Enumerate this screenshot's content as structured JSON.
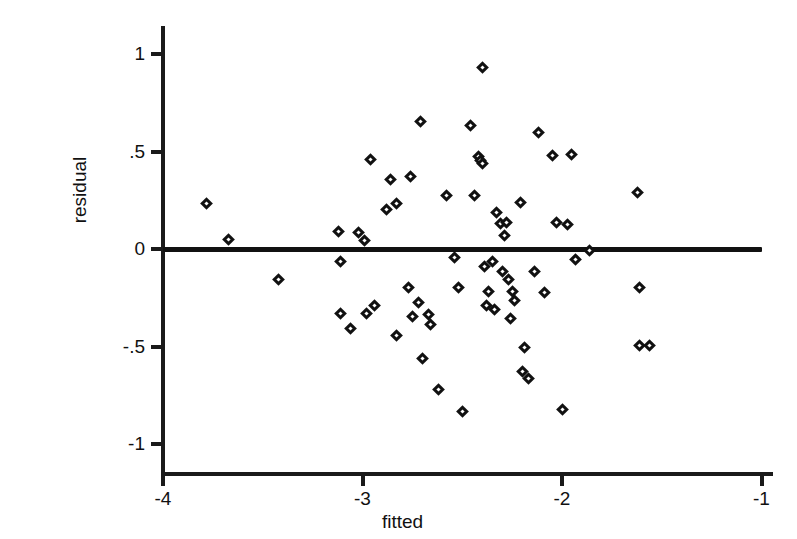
{
  "chart_data": {
    "type": "scatter",
    "title": "",
    "xlabel": "fitted",
    "ylabel": "residual",
    "xlim": [
      -4.0,
      -1.0
    ],
    "ylim": [
      -1.15,
      1.08
    ],
    "xticks": [
      -4,
      -3,
      -2,
      -1
    ],
    "xtick_labels": [
      "-4",
      "-3",
      "-2",
      "-1"
    ],
    "yticks": [
      1,
      0.5,
      0,
      -0.5,
      -1
    ],
    "ytick_labels": [
      "1",
      ".5",
      "0",
      "-.5",
      "-1"
    ],
    "grid": false,
    "legend": null,
    "marker": "open-diamond",
    "marker_color": "#111111",
    "reference_line": {
      "type": "horizontal",
      "y": 0,
      "x_start": -4.0,
      "x_end": -1.0,
      "color": "#111111"
    },
    "points": [
      {
        "x": -3.78,
        "y": 0.235
      },
      {
        "x": -3.67,
        "y": 0.05
      },
      {
        "x": -3.42,
        "y": -0.155
      },
      {
        "x": -3.12,
        "y": 0.09
      },
      {
        "x": -3.11,
        "y": -0.065
      },
      {
        "x": -3.11,
        "y": -0.33
      },
      {
        "x": -3.06,
        "y": -0.41
      },
      {
        "x": -3.02,
        "y": 0.085
      },
      {
        "x": -2.99,
        "y": 0.045
      },
      {
        "x": -2.98,
        "y": -0.33
      },
      {
        "x": -2.96,
        "y": 0.46
      },
      {
        "x": -2.94,
        "y": -0.29
      },
      {
        "x": -2.88,
        "y": 0.205
      },
      {
        "x": -2.86,
        "y": 0.355
      },
      {
        "x": -2.83,
        "y": 0.235
      },
      {
        "x": -2.83,
        "y": -0.445
      },
      {
        "x": -2.77,
        "y": -0.195
      },
      {
        "x": -2.76,
        "y": 0.37
      },
      {
        "x": -2.75,
        "y": -0.345
      },
      {
        "x": -2.72,
        "y": -0.275
      },
      {
        "x": -2.71,
        "y": 0.655
      },
      {
        "x": -2.7,
        "y": -0.56
      },
      {
        "x": -2.67,
        "y": -0.335
      },
      {
        "x": -2.66,
        "y": -0.385
      },
      {
        "x": -2.62,
        "y": -0.72
      },
      {
        "x": -2.58,
        "y": 0.275
      },
      {
        "x": -2.54,
        "y": -0.045
      },
      {
        "x": -2.52,
        "y": -0.195
      },
      {
        "x": -2.5,
        "y": -0.835
      },
      {
        "x": -2.46,
        "y": 0.635
      },
      {
        "x": -2.44,
        "y": 0.275
      },
      {
        "x": -2.42,
        "y": 0.475
      },
      {
        "x": -2.41,
        "y": 0.455
      },
      {
        "x": -2.4,
        "y": 0.44
      },
      {
        "x": -2.4,
        "y": 0.93
      },
      {
        "x": -2.39,
        "y": -0.09
      },
      {
        "x": -2.38,
        "y": -0.29
      },
      {
        "x": -2.37,
        "y": -0.22
      },
      {
        "x": -2.35,
        "y": -0.065
      },
      {
        "x": -2.34,
        "y": -0.31
      },
      {
        "x": -2.33,
        "y": 0.185
      },
      {
        "x": -2.31,
        "y": 0.13
      },
      {
        "x": -2.3,
        "y": -0.115
      },
      {
        "x": -2.29,
        "y": 0.07
      },
      {
        "x": -2.28,
        "y": 0.135
      },
      {
        "x": -2.27,
        "y": -0.155
      },
      {
        "x": -2.26,
        "y": -0.355
      },
      {
        "x": -2.25,
        "y": -0.22
      },
      {
        "x": -2.24,
        "y": -0.265
      },
      {
        "x": -2.21,
        "y": 0.24
      },
      {
        "x": -2.2,
        "y": -0.63
      },
      {
        "x": -2.19,
        "y": -0.505
      },
      {
        "x": -2.17,
        "y": -0.665
      },
      {
        "x": -2.14,
        "y": -0.115
      },
      {
        "x": -2.12,
        "y": 0.6
      },
      {
        "x": -2.09,
        "y": -0.225
      },
      {
        "x": -2.05,
        "y": 0.48
      },
      {
        "x": -2.03,
        "y": 0.135
      },
      {
        "x": -2.0,
        "y": -0.825
      },
      {
        "x": -1.97,
        "y": 0.125
      },
      {
        "x": -1.95,
        "y": 0.485
      },
      {
        "x": -1.93,
        "y": -0.055
      },
      {
        "x": -1.86,
        "y": -0.01
      },
      {
        "x": -1.62,
        "y": 0.29
      },
      {
        "x": -1.61,
        "y": -0.195
      },
      {
        "x": -1.61,
        "y": -0.495
      },
      {
        "x": -1.56,
        "y": -0.495
      }
    ]
  },
  "axes": {
    "x_title": "fitted",
    "y_title": "residual"
  }
}
